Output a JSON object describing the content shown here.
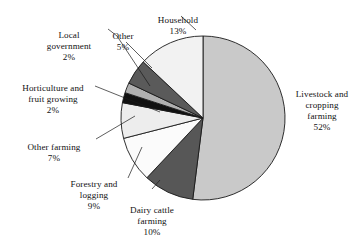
{
  "chart_data": {
    "type": "pie",
    "title": "",
    "subtitle": "",
    "xlabel": "",
    "ylabel": "",
    "legend_position": "callout-labels",
    "grid": false,
    "total": 100,
    "units": "percent",
    "categories": [
      "Livestock and cropping farming",
      "Dairy cattle farming",
      "Forestry and logging",
      "Other farming",
      "Horticulture and fruit growing",
      "Local government",
      "Other",
      "Household"
    ],
    "values": [
      52,
      10,
      9,
      7,
      2,
      2,
      5,
      13
    ],
    "slices": [
      {
        "label": "Livestock and cropping farming",
        "label_lines": "Livestock and\ncropping\nfarming",
        "value": 52,
        "pct_text": "52%",
        "color": "#c9c9c9"
      },
      {
        "label": "Dairy cattle farming",
        "label_lines": "Dairy cattle\nfarming",
        "value": 10,
        "pct_text": "10%",
        "color": "#575757"
      },
      {
        "label": "Forestry and logging",
        "label_lines": "Forestry and\nlogging",
        "value": 9,
        "pct_text": "9%",
        "color": "#fbfbfb"
      },
      {
        "label": "Other farming",
        "label_lines": "Other farming",
        "value": 7,
        "pct_text": "7%",
        "color": "#ededed"
      },
      {
        "label": "Horticulture and fruit growing",
        "label_lines": "Horticulture and\nfruit growing",
        "value": 2,
        "pct_text": "2%",
        "color": "#111111"
      },
      {
        "label": "Local government",
        "label_lines": "Local\ngovernment",
        "value": 2,
        "pct_text": "2%",
        "color": "#b0b0b0"
      },
      {
        "label": "Other",
        "label_lines": "Other",
        "value": 5,
        "pct_text": "5%",
        "color": "#5a5a5a"
      },
      {
        "label": "Household",
        "label_lines": "Household",
        "value": 13,
        "pct_text": "13%",
        "color": "#f2f2f2"
      }
    ]
  },
  "labels": {
    "household": {
      "name": "Household",
      "pct": "13%"
    },
    "other": {
      "name": "Other",
      "pct": "5%"
    },
    "local_government": {
      "name": "Local\ngovernment",
      "pct": "2%"
    },
    "horticulture": {
      "name": "Horticulture and\nfruit growing",
      "pct": "2%"
    },
    "other_farming": {
      "name": "Other farming",
      "pct": "7%"
    },
    "forestry": {
      "name": "Forestry and\nlogging",
      "pct": "9%"
    },
    "dairy": {
      "name": "Dairy cattle\nfarming",
      "pct": "10%"
    },
    "livestock": {
      "name": "Livestock and\ncropping\nfarming",
      "pct": "52%"
    }
  },
  "colors": {
    "outline": "#1a1a1a",
    "background": "#ffffff",
    "text": "#111111"
  }
}
